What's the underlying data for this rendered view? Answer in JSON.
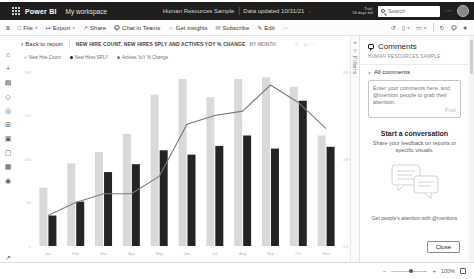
{
  "header": {
    "brand": "Power BI",
    "workspace": "My workspace",
    "report_name": "Human Resources Sample",
    "data_updated": "Data updated 10/31/21",
    "trial_line1": "Trial:",
    "trial_line2": "56 days left",
    "search_placeholder": "Search",
    "more": "⋯"
  },
  "toolbar": {
    "file": "File",
    "export": "Export",
    "share": "Share",
    "chat": "Chat in Teams",
    "insights": "Get insights",
    "subscribe": "Subscribe",
    "edit": "Edit",
    "more": "⋯"
  },
  "icons": {
    "menu": "≡",
    "home": "⌂",
    "create": "+",
    "browse": "▤",
    "data_hub": "◇",
    "goals": "◎",
    "apps": "⊞",
    "pipelines": "▣",
    "learn": "▢",
    "workspaces": "▦",
    "my_workspace": "◉",
    "expand": "↗",
    "caret": "∨",
    "back": "‹",
    "file": "□",
    "export": "↦",
    "share": "↗",
    "insights": "☼",
    "subscribe": "✉",
    "edit": "✎",
    "reset": "↺",
    "bookmark": "▯",
    "view": "▭",
    "refresh": "↻",
    "favorite": "★",
    "funnel": "▽",
    "collapse": "«",
    "copy": "□",
    "more": "⋯",
    "minus": "−",
    "plus": "+"
  },
  "canvas": {
    "back_to_report": "Back to report"
  },
  "filters_pane": {
    "label": "Filters"
  },
  "comments": {
    "title": "Comments",
    "subtitle": "HUMAN RESOURCES SAMPLE",
    "all_comments": "All comments",
    "input_placeholder": "Enter your comments here, and @mention people to grab their attention.",
    "post": "Post",
    "start_title": "Start a conversation",
    "start_sub": "Share your feedback on reports or specific visuals.",
    "mentions_hint": "Get people's attention with @mentions",
    "close": "Close"
  },
  "statusbar": {
    "zoom": "100%"
  },
  "chart_data": {
    "type": "bar",
    "subtype": "clustered-column-with-line",
    "title": "NEW HIRE COUNT, NEW HIRES SPLY AND ACTIVES YOY % CHANGE",
    "title_suffix": "BY MONTH",
    "categories": [
      "Jan",
      "Feb",
      "Mar",
      "Apr",
      "May",
      "Jun",
      "Jul",
      "Aug",
      "Sep",
      "Oct",
      "Nov"
    ],
    "series": [
      {
        "name": "New Hire Count",
        "type": "bar",
        "color": "#d9d9d9",
        "values": [
          67,
          95,
          108,
          129,
          174,
          192,
          171,
          192,
          194,
          183,
          127
        ]
      },
      {
        "name": "New Hires SPLY",
        "type": "bar",
        "color": "#252423",
        "values": [
          35,
          51,
          85,
          94,
          110,
          105,
          115,
          127,
          112,
          167,
          114
        ]
      },
      {
        "name": "Actives YoY % Change",
        "type": "line",
        "color": "#7a7a7a",
        "values": [
          7,
          10,
          12,
          12,
          16,
          28,
          30,
          31,
          37,
          33,
          27
        ]
      }
    ],
    "bar_axis": {
      "min": 0,
      "max": 200,
      "ticks": [
        0,
        50,
        100,
        150,
        200
      ]
    },
    "line_axis": {
      "min": 0,
      "max": 40,
      "ticks": [
        0,
        20,
        40
      ],
      "suffix": "%"
    },
    "grid": false,
    "legend_position": "top"
  }
}
